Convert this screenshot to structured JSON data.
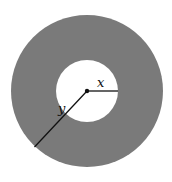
{
  "diagram": {
    "type": "annulus",
    "center": {
      "x": 87,
      "y": 91
    },
    "outer_radius": 76,
    "inner_radius": 31,
    "colors": {
      "ring": "#7a7a7a",
      "hole": "#ffffff",
      "lines": "#111111",
      "background": "#ffffff"
    },
    "labels": {
      "inner_radius": "x",
      "outer_radius": "y"
    }
  }
}
